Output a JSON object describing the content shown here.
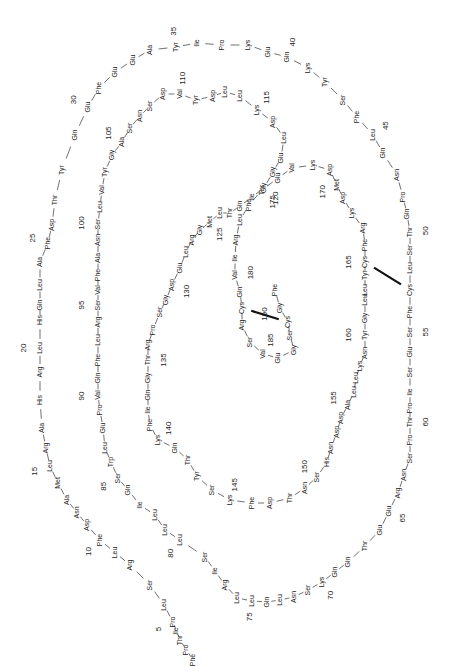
{
  "figure": {
    "type": "protein primary structure spiral",
    "orientation": "rotated 90 degrees clockwise"
  },
  "sequence": [
    "Phe",
    "Pro",
    "Thr",
    "Ile",
    "Pro",
    "Leu",
    "Ser",
    "Arg",
    "Leu",
    "Phe",
    "Asp",
    "Asn",
    "Ala",
    "Met",
    "Leu",
    "Arg",
    "Ala",
    "His",
    "Arg",
    "Leu",
    "His",
    "Gln",
    "Leu",
    "Ala",
    "Phe",
    "Asp",
    "Thr",
    "Tyr",
    "Gln",
    "Glu",
    "Phe",
    "Glu",
    "Glu",
    "Ala",
    "Tyr",
    "Ile",
    "Pro",
    "Lys",
    "Glu",
    "Gln",
    "Lys",
    "Tyr",
    "Ser",
    "Phe",
    "Leu",
    "Gln",
    "Asn",
    "Pro",
    "Gln",
    "Thr",
    "Ser",
    "Leu",
    "Cys",
    "Phe",
    "Ser",
    "Glu",
    "Ser",
    "Ile",
    "Pro",
    "Thr",
    "Pro",
    "Ser",
    "Asn",
    "Arg",
    "Glu",
    "Glu",
    "Thr",
    "Gln",
    "Gln",
    "Lys",
    "Ser",
    "Asn",
    "Leu",
    "Gln",
    "Leu",
    "Leu",
    "Arg",
    "Ile",
    "Ser",
    "Leu",
    "Leu",
    "Leu",
    "Ile",
    "Gln",
    "Ser",
    "Trp",
    "Leu",
    "Glu",
    "Pro",
    "Val",
    "Gln",
    "Phe",
    "Leu",
    "Arg",
    "Ser",
    "Val",
    "Phe",
    "Ala",
    "Asn",
    "Ser",
    "Leu",
    "Val",
    "Tyr",
    "Gly",
    "Ala",
    "Ser",
    "Asn",
    "Ser",
    "Asp",
    "Val",
    "Tyr",
    "Asp",
    "Leu",
    "Leu",
    "Lys",
    "Asp",
    "Leu",
    "Glu",
    "Gly",
    "Gly",
    "Ile",
    "Gln",
    "Thr",
    "Leu",
    "Met",
    "Gly",
    "Arg",
    "Leu",
    "Glu",
    "Asp",
    "Gly",
    "Ser",
    "Pro",
    "Arg",
    "Thr",
    "Gly",
    "Gln",
    "Ile",
    "Phe",
    "Lys",
    "Gln",
    "Thr",
    "Tyr",
    "Ser",
    "Lys",
    "Phe",
    "Asp",
    "Thr",
    "Asn",
    "Ser",
    "His",
    "Asn",
    "Asp",
    "Asp",
    "Ala",
    "Leu",
    "Leu",
    "Lys",
    "Asn",
    "Tyr",
    "Gly",
    "Leu",
    "Leu",
    "Tyr",
    "Cys",
    "Phe",
    "Arg",
    "Lys",
    "Asp",
    "Met",
    "Asp",
    "Lys",
    "Val",
    "Glu",
    "Thr",
    "Phe",
    "Leu",
    "Arg",
    "Ile",
    "Val",
    "Gln",
    "Cys",
    "Arg",
    "Ser",
    "Val",
    "Glu",
    "Gly",
    "Ser",
    "Cys",
    "Gly",
    "Phe"
  ],
  "position_labels": [
    "5",
    "10",
    "15",
    "20",
    "25",
    "30",
    "35",
    "40",
    "45",
    "50",
    "55",
    "60",
    "65",
    "70",
    "75",
    "80",
    "85",
    "90",
    "95",
    "100",
    "105",
    "110",
    "115",
    "120",
    "125",
    "130",
    "135",
    "140",
    "145",
    "150",
    "155",
    "160",
    "165",
    "170",
    "175",
    "180",
    "185",
    "190"
  ],
  "disulfide_bonds": [
    {
      "from": "Cys53",
      "to": "Cys165"
    },
    {
      "from": "Cys182",
      "to": "Cys189"
    }
  ]
}
